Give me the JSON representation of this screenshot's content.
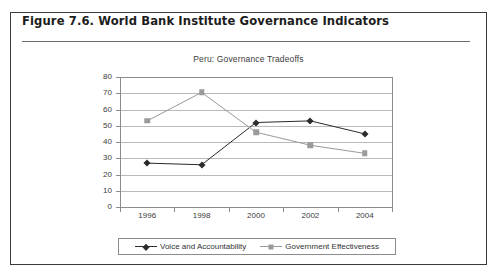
{
  "figure": {
    "caption": "Figure 7.6.  World Bank Institute Governance Indicators"
  },
  "chart_data": {
    "type": "line",
    "title": "Peru: Governance Tradeoffs",
    "xlabel": "",
    "ylabel": "",
    "categories": [
      "1996",
      "1998",
      "2000",
      "2002",
      "2004"
    ],
    "ylim": [
      0,
      80
    ],
    "yticks": [
      "0",
      "10",
      "20",
      "30",
      "40",
      "50",
      "60",
      "70",
      "80"
    ],
    "grid": true,
    "legend_position": "bottom",
    "series": [
      {
        "name": "Voice and Accountability",
        "color": "#2b2b2b",
        "marker": "diamond",
        "values": [
          27,
          26,
          52,
          53,
          45
        ]
      },
      {
        "name": "Government Effectiveness",
        "color": "#9a9a9a",
        "marker": "square",
        "values": [
          53,
          70.5,
          46,
          38,
          33
        ]
      }
    ]
  }
}
